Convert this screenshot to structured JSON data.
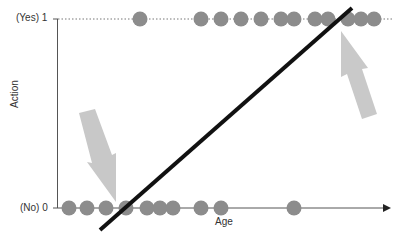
{
  "chart_data": {
    "type": "scatter",
    "title": "",
    "xlabel": "Age",
    "ylabel": "Action",
    "y_ticks": [
      {
        "value": 0,
        "label": "(No)  0"
      },
      {
        "value": 1,
        "label": "(Yes)  1"
      }
    ],
    "ylim": [
      0,
      1
    ],
    "x_ticks": [],
    "grid": false,
    "legend": null,
    "series": [
      {
        "name": "No (0)",
        "y": 0,
        "x_pixel_positions": [
          69,
          87,
          106,
          126,
          147,
          160,
          173,
          201,
          221,
          294
        ]
      },
      {
        "name": "Yes (1)",
        "y": 1,
        "x_pixel_positions": [
          140,
          201,
          221,
          241,
          261,
          281,
          294,
          315,
          328,
          348,
          361,
          374
        ]
      }
    ],
    "fit_line": {
      "type": "linear",
      "from_px": [
        100,
        230
      ],
      "to_px": [
        352,
        8
      ],
      "color": "#111111"
    },
    "annotations": [
      {
        "type": "arrow",
        "direction": "down",
        "points_to": "misclassified region near x-intercept at y=0",
        "color": "#c8c8c8"
      },
      {
        "type": "arrow",
        "direction": "up",
        "points_to": "line overshoot beyond y=1",
        "color": "#c8c8c8"
      }
    ]
  },
  "labels": {
    "y_yes": "(Yes)  1",
    "y_no": "(No)  0",
    "xlabel": "Age",
    "ylabel": "Action"
  },
  "colors": {
    "dot": "#8c8c8c",
    "axis": "#555555",
    "line": "#111111",
    "arrow": "#c8c8c8"
  }
}
